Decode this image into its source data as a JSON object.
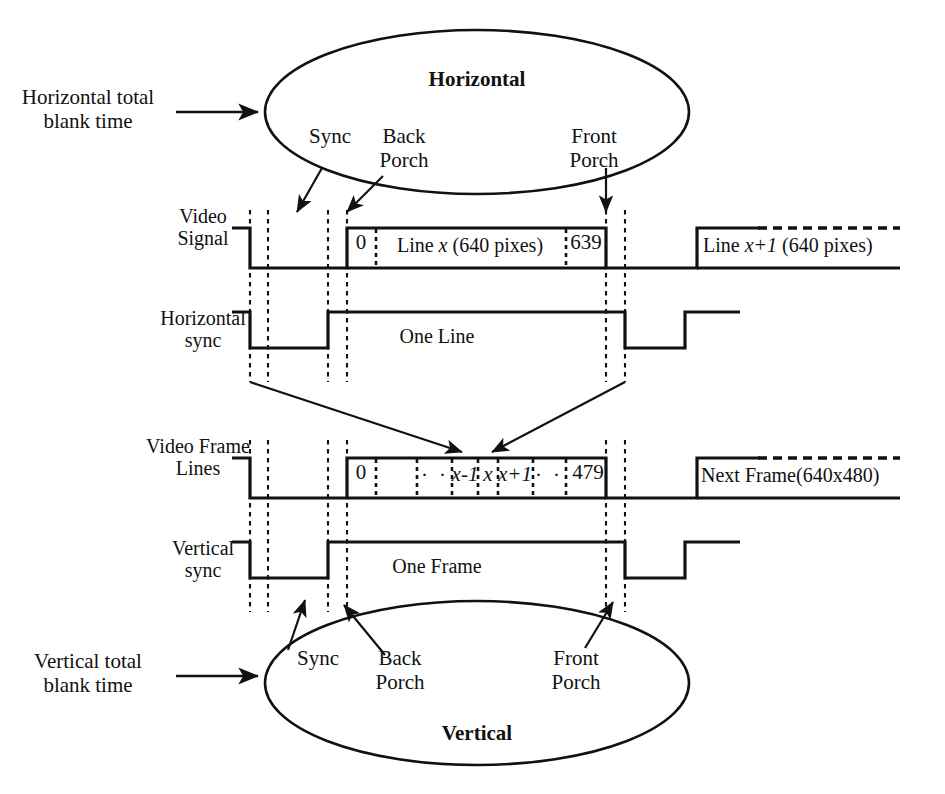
{
  "figure": {
    "kind": "vga-timing-diagram",
    "width": 945,
    "height": 794,
    "ink_color": "#111111",
    "background_color": "#ffffff"
  },
  "callouts": {
    "horizontal_blank": "Horizontal total\nblank time",
    "vertical_blank": "Vertical total\nblank time"
  },
  "horizontal_bubble": {
    "title": "Horizontal",
    "sync": "Sync",
    "back_porch": "Back\nPorch",
    "front_porch": "Front\nPorch"
  },
  "vertical_bubble": {
    "title": "Vertical",
    "sync": "Sync",
    "back_porch": "Back\nPorch",
    "front_porch": "Front\nPorch"
  },
  "rows": {
    "video_signal": {
      "label": "Video\nSignal",
      "active_start_index": "0",
      "active_text_pre": "Line ",
      "active_text_var": "x",
      "active_text_post": " (640 pixes)",
      "active_end_index": "639",
      "next_text_pre": "Line ",
      "next_text_var": "x+1",
      "next_text_post": " (640 pixes)"
    },
    "horizontal_sync": {
      "label": "Horizontal\nsync",
      "period_text": "One Line"
    },
    "video_frame_lines": {
      "label": "Video Frame\nLines",
      "active_start_index": "0",
      "dots_left": "· ·",
      "line_minus": "x-1",
      "line_x": "x",
      "line_plus": "x+1",
      "dots_right": "· ·",
      "active_end_index": "479",
      "next_text": "Next Frame(640x480)"
    },
    "vertical_sync": {
      "label": "Vertical\nsync",
      "period_text": "One Frame"
    }
  }
}
